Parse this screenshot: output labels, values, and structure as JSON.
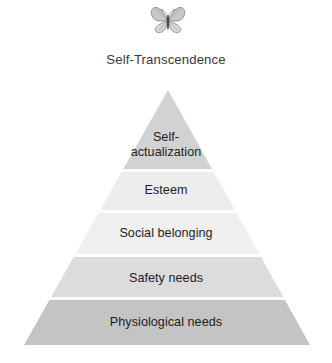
{
  "figure": {
    "background_color": "#ffffff",
    "text_color": "#1d1d1d"
  },
  "crown": {
    "icon_name": "butterfly-icon",
    "label": "Self-Transcendence",
    "label_color": "#3a3a3a"
  },
  "pyramid": {
    "apex_x": 168,
    "apex_y": 90,
    "base_left_x": 24,
    "base_right_x": 310,
    "base_y": 345,
    "gap_color": "#ffffff",
    "tiers": [
      {
        "label": "Self-\nactualization",
        "name": "self-actualization",
        "level": 5,
        "fill": "#d2d2d2",
        "top_y": 90,
        "bottom_y": 169
      },
      {
        "label": "Esteem",
        "name": "esteem",
        "level": 4,
        "fill": "#ededed",
        "top_y": 172,
        "bottom_y": 210
      },
      {
        "label": "Social belonging",
        "name": "social-belonging",
        "level": 3,
        "fill": "#efefef",
        "top_y": 213,
        "bottom_y": 254
      },
      {
        "label": "Safety needs",
        "name": "safety-needs",
        "level": 2,
        "fill": "#dcdcdc",
        "top_y": 257,
        "bottom_y": 297
      },
      {
        "label": "Physiological needs",
        "name": "physiological-needs",
        "level": 1,
        "fill": "#c4c4c4",
        "top_y": 300,
        "bottom_y": 345
      }
    ]
  },
  "chart_data": {
    "type": "pyramid",
    "categories": [
      "Physiological needs",
      "Safety needs",
      "Social belonging",
      "Esteem",
      "Self-actualization",
      "Self-Transcendence"
    ],
    "levels": [
      1,
      2,
      3,
      4,
      5,
      6
    ],
    "legend": "none",
    "grid": false
  }
}
